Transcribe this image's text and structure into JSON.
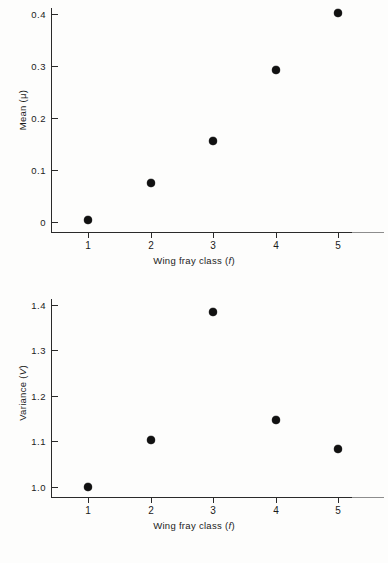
{
  "chart_data": [
    {
      "id": "mean",
      "type": "scatter",
      "title": "",
      "xlabel": "Wing fray class (f)",
      "xlabel_plain": "Wing fray class",
      "xlabel_symbol": "f",
      "ylabel": "Mean (μ)",
      "ylabel_plain": "Mean",
      "ylabel_symbol": "μ",
      "x": [
        1,
        2,
        3,
        4,
        5
      ],
      "values": [
        0.003,
        0.075,
        0.155,
        0.292,
        0.402
      ],
      "xticklabels": [
        "1",
        "2",
        "3",
        "4",
        "5"
      ],
      "yticklabels": [
        "0",
        "0.1",
        "0.2",
        "0.3",
        "0.4"
      ],
      "ytickvalues": [
        0,
        0.1,
        0.2,
        0.3,
        0.4
      ],
      "xlim": [
        0.55,
        5.55
      ],
      "ylim": [
        0,
        0.43
      ],
      "grid": false,
      "legend": false,
      "marker": "filled-circle",
      "marker_color": "#111111"
    },
    {
      "id": "variance",
      "type": "scatter",
      "title": "",
      "xlabel": "Wing fray class (f)",
      "xlabel_plain": "Wing fray class",
      "xlabel_symbol": "f",
      "ylabel": "Variance (V)",
      "ylabel_plain": "Variance",
      "ylabel_symbol": "V",
      "x": [
        1,
        2,
        3,
        4,
        5
      ],
      "values": [
        1.0,
        1.103,
        1.385,
        1.148,
        1.083
      ],
      "xticklabels": [
        "1",
        "2",
        "3",
        "4",
        "5"
      ],
      "yticklabels": [
        "1.0",
        "1.1",
        "1.2",
        "1.3",
        "1.4"
      ],
      "ytickvalues": [
        1.0,
        1.1,
        1.2,
        1.3,
        1.4
      ],
      "xlim": [
        0.55,
        5.55
      ],
      "ylim": [
        0.975,
        1.425
      ],
      "grid": false,
      "legend": false,
      "marker": "filled-circle",
      "marker_color": "#111111"
    }
  ]
}
